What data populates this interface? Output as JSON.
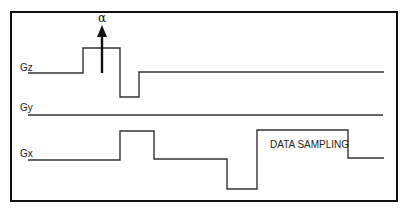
{
  "diagram": {
    "title": "",
    "frame": {
      "x": 11,
      "y": 12,
      "width": 386,
      "height": 189
    },
    "channels": [
      {
        "label": "Gz",
        "label_pos": [
          20,
          71
        ],
        "points": [
          [
            28,
            73
          ],
          [
            83,
            73
          ],
          [
            83,
            48
          ],
          [
            120,
            48
          ],
          [
            120,
            97
          ],
          [
            139,
            97
          ],
          [
            139,
            72
          ],
          [
            384,
            72
          ]
        ]
      },
      {
        "label": "Gy",
        "label_pos": [
          20,
          111
        ],
        "points": [
          [
            28,
            115
          ],
          [
            383,
            115
          ]
        ]
      },
      {
        "label": "Gx",
        "label_pos": [
          20,
          157
        ],
        "points": [
          [
            28,
            160
          ],
          [
            120,
            160
          ],
          [
            120,
            131
          ],
          [
            154,
            131
          ],
          [
            154,
            159
          ],
          [
            227,
            159
          ],
          [
            227,
            189
          ],
          [
            257,
            189
          ],
          [
            257,
            130
          ],
          [
            348,
            130
          ],
          [
            348,
            158
          ],
          [
            384,
            158
          ]
        ]
      }
    ],
    "pulse": {
      "symbol": "α",
      "arrow_x": 102,
      "arrow_from_y": 73,
      "arrow_to_y": 27,
      "symbol_y": 22
    },
    "annotation": {
      "text": "DATA SAMPLING",
      "x": 270,
      "y": 148
    }
  }
}
